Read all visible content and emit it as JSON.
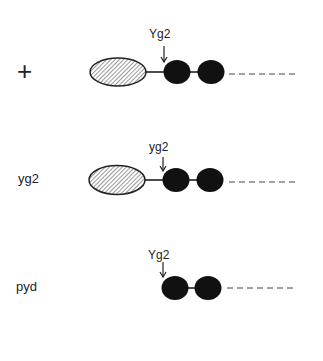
{
  "figure": {
    "rows": [
      {
        "genotype": "+",
        "site_label": "Yg2",
        "has_hatched_domain": true,
        "dark_domains": 2
      },
      {
        "genotype": "yg2",
        "site_label": "yg2",
        "has_hatched_domain": true,
        "dark_domains": 2
      },
      {
        "genotype": "pyd",
        "site_label": "Yg2",
        "has_hatched_domain": false,
        "dark_domains": 2
      }
    ],
    "colors": {
      "dark_domain": "#111111",
      "hatch": "#333333",
      "background": "#ffffff"
    }
  }
}
